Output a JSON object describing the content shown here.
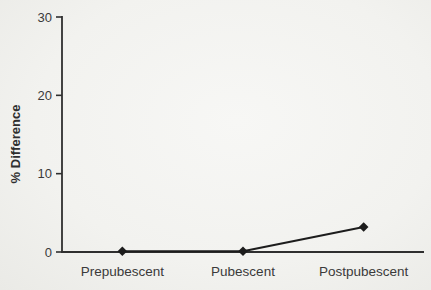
{
  "figure": {
    "paper_color": "#f2f2ef",
    "ink_color": "#2f2f2f"
  },
  "chart_data": {
    "type": "line",
    "title": "",
    "categories": [
      "Prepubescent",
      "Pubescent",
      "Postpubescent"
    ],
    "series": [
      {
        "name": "% Difference",
        "marker": "diamond",
        "color": "#1c1c1c",
        "values": [
          0.1,
          0.1,
          3.2
        ]
      }
    ],
    "xlabel": "",
    "ylabel": "% Difference",
    "ylim": [
      0,
      30
    ],
    "yticks": [
      0,
      10,
      20,
      30
    ],
    "grid": false,
    "legend_position": "none"
  }
}
